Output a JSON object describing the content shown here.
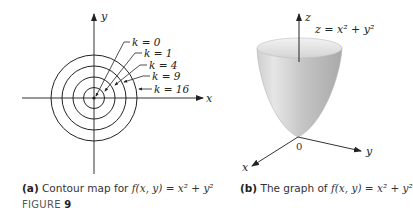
{
  "panel_a": {
    "axis_x_label": "x",
    "axis_y_label": "y",
    "contour_labels": [
      "k = 0",
      "k = 1",
      "k = 4",
      "k = 9",
      "k = 16"
    ],
    "caption_tag": "(a)",
    "caption_text": "Contour map for ",
    "caption_func": "f(x, y) = x² + y²"
  },
  "panel_b": {
    "axis_x_label": "x",
    "axis_y_label": "y",
    "axis_z_label": "z",
    "origin_label": "0",
    "surface_label": "z = x² + y²",
    "caption_tag": "(b)",
    "caption_text": " The graph of ",
    "caption_func": "f(x, y) = x² + y²"
  },
  "figure": {
    "label": "FIGURE",
    "number": "9"
  }
}
